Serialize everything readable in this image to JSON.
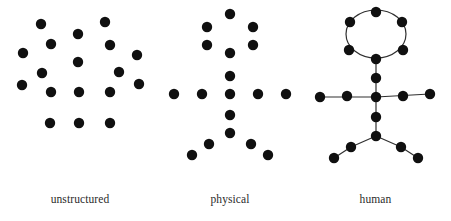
{
  "figure": {
    "background_color": "#ffffff",
    "dot_color": "#101010",
    "line_color": "#303030",
    "caption_color": "#2b2b2b",
    "dot_radius": 5.2
  },
  "panels": [
    {
      "id": "unstructured",
      "name": "unstructured-nonhuman-entities",
      "caption_line1": "unstructured",
      "caption_line2": "nonhuman entities",
      "dot_count": 17,
      "has_connectors": false,
      "dots": [
        {
          "x": 41,
          "y": 24
        },
        {
          "x": 105,
          "y": 22
        },
        {
          "x": 78,
          "y": 34
        },
        {
          "x": 51,
          "y": 44
        },
        {
          "x": 110,
          "y": 45
        },
        {
          "x": 23,
          "y": 53
        },
        {
          "x": 137,
          "y": 55
        },
        {
          "x": 42,
          "y": 73
        },
        {
          "x": 78,
          "y": 62
        },
        {
          "x": 119,
          "y": 72
        },
        {
          "x": 22,
          "y": 85
        },
        {
          "x": 139,
          "y": 84
        },
        {
          "x": 51,
          "y": 92
        },
        {
          "x": 79,
          "y": 92
        },
        {
          "x": 110,
          "y": 92
        },
        {
          "x": 50,
          "y": 123
        },
        {
          "x": 79,
          "y": 123
        },
        {
          "x": 110,
          "y": 123
        }
      ],
      "connectors": []
    },
    {
      "id": "physical",
      "name": "physical-structure",
      "caption_line1": "physical",
      "caption_line2": "structure",
      "dot_count": 18,
      "has_connectors": false,
      "dots": [
        {
          "x": 70,
          "y": 14
        },
        {
          "x": 47,
          "y": 27
        },
        {
          "x": 93,
          "y": 27
        },
        {
          "x": 47,
          "y": 45
        },
        {
          "x": 93,
          "y": 45
        },
        {
          "x": 70,
          "y": 53
        },
        {
          "x": 70,
          "y": 76
        },
        {
          "x": 14,
          "y": 94
        },
        {
          "x": 42,
          "y": 94
        },
        {
          "x": 70,
          "y": 94
        },
        {
          "x": 98,
          "y": 94
        },
        {
          "x": 126,
          "y": 94
        },
        {
          "x": 70,
          "y": 115
        },
        {
          "x": 70,
          "y": 133
        },
        {
          "x": 49,
          "y": 144
        },
        {
          "x": 91,
          "y": 144
        },
        {
          "x": 32,
          "y": 155
        },
        {
          "x": 108,
          "y": 155
        }
      ],
      "connectors": []
    },
    {
      "id": "human",
      "name": "human-structure",
      "caption_line1": "human",
      "caption_line2": "structure",
      "dot_count": 17,
      "has_connectors": true,
      "head_ellipse": {
        "cx": 76,
        "cy": 34,
        "rx": 30,
        "ry": 24
      },
      "dots": [
        {
          "x": 76,
          "y": 12
        },
        {
          "x": 50,
          "y": 22
        },
        {
          "x": 102,
          "y": 22
        },
        {
          "x": 49,
          "y": 50
        },
        {
          "x": 103,
          "y": 50
        },
        {
          "x": 76,
          "y": 59
        },
        {
          "x": 76,
          "y": 78
        },
        {
          "x": 20,
          "y": 97
        },
        {
          "x": 47,
          "y": 96
        },
        {
          "x": 76,
          "y": 97
        },
        {
          "x": 103,
          "y": 96
        },
        {
          "x": 130,
          "y": 94
        },
        {
          "x": 76,
          "y": 117
        },
        {
          "x": 76,
          "y": 136
        },
        {
          "x": 51,
          "y": 147
        },
        {
          "x": 101,
          "y": 147
        },
        {
          "x": 34,
          "y": 158
        },
        {
          "x": 118,
          "y": 158
        }
      ],
      "connectors": [
        {
          "x1": 76,
          "y1": 59,
          "x2": 76,
          "y2": 78
        },
        {
          "x1": 76,
          "y1": 78,
          "x2": 76,
          "y2": 97
        },
        {
          "x1": 76,
          "y1": 97,
          "x2": 76,
          "y2": 117
        },
        {
          "x1": 76,
          "y1": 117,
          "x2": 76,
          "y2": 136
        },
        {
          "x1": 20,
          "y1": 97,
          "x2": 76,
          "y2": 97
        },
        {
          "x1": 76,
          "y1": 97,
          "x2": 130,
          "y2": 94
        },
        {
          "x1": 76,
          "y1": 136,
          "x2": 51,
          "y2": 147
        },
        {
          "x1": 51,
          "y1": 147,
          "x2": 34,
          "y2": 158
        },
        {
          "x1": 76,
          "y1": 136,
          "x2": 101,
          "y2": 147
        },
        {
          "x1": 101,
          "y1": 147,
          "x2": 118,
          "y2": 158
        }
      ]
    }
  ]
}
